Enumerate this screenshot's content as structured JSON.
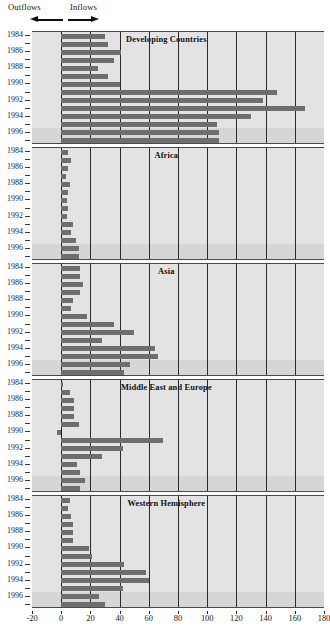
{
  "legend": {
    "outflows_label": "Outflows",
    "inflows_label": "Inflows",
    "outflow_arrow_icon": "arrow-left-icon",
    "inflow_arrow_icon": "arrow-right-icon"
  },
  "axis": {
    "x_ticks": [
      -20,
      0,
      20,
      40,
      60,
      80,
      100,
      120,
      140,
      160,
      180
    ],
    "x_min": -20,
    "x_max": 180,
    "y_ticks": [
      1984,
      1986,
      1988,
      1990,
      1992,
      1994,
      1996
    ],
    "years": [
      1984,
      1985,
      1986,
      1987,
      1988,
      1989,
      1990,
      1991,
      1992,
      1993,
      1994,
      1995,
      1996,
      1997
    ]
  },
  "colors": {
    "bar": "#6e6e6e",
    "panel_background": "#e3e3e3",
    "band_highlight": "#d6d6d6",
    "gridline": "#2a2a2a",
    "text": "#1a1a1a"
  },
  "chart_data": {
    "type": "bar",
    "title": "",
    "xlabel": "",
    "ylabel": "",
    "xlim": [
      -20,
      180
    ],
    "grid": true,
    "orientation": "horizontal",
    "legend_position": "top-left",
    "categories": [
      1984,
      1985,
      1986,
      1987,
      1988,
      1989,
      1990,
      1991,
      1992,
      1993,
      1994,
      1995,
      1996,
      1997
    ],
    "panels": [
      {
        "title": "Developing Countries",
        "values": [
          30,
          32,
          41,
          36,
          25,
          32,
          40,
          148,
          138,
          167,
          130,
          107,
          108,
          108
        ]
      },
      {
        "title": "Africa",
        "values": [
          5,
          7,
          5,
          3,
          6,
          5,
          4,
          5,
          4,
          8,
          7,
          10,
          12,
          12
        ]
      },
      {
        "title": "Asia",
        "values": [
          13,
          13,
          15,
          13,
          8,
          7,
          18,
          36,
          50,
          28,
          64,
          66,
          47,
          43
        ]
      },
      {
        "title": "Middle East and Europe",
        "values": [
          1,
          6,
          9,
          9,
          9,
          12,
          -3,
          70,
          42,
          28,
          11,
          13,
          16,
          13
        ]
      },
      {
        "title": "Western Hemisphere",
        "values": [
          6,
          5,
          7,
          8,
          8,
          8,
          19,
          21,
          43,
          58,
          60,
          42,
          26,
          30
        ]
      }
    ]
  }
}
